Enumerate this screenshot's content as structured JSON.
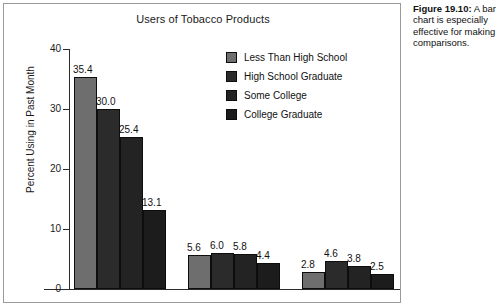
{
  "figure": {
    "caption_number": "Figure 19.10:",
    "caption_text": "A bar chart is especially effective for making comparisons."
  },
  "chart_data": {
    "type": "bar",
    "title": "Users of Tobacco Products",
    "xlabel": "",
    "ylabel": "Percent Using in Past Month",
    "ylim": [
      0,
      40
    ],
    "yticks": [
      0,
      10,
      20,
      30,
      40
    ],
    "ytick_labels": [
      "0",
      "10",
      "20",
      "30",
      "40"
    ],
    "grid": false,
    "legend_position": "upper right",
    "categories": [
      "Group 1",
      "Group 2",
      "Group 3"
    ],
    "category_labels": [
      "",
      "",
      ""
    ],
    "series": [
      {
        "name": "Less Than High School",
        "color": "#6e6e6e",
        "values": [
          35.4,
          5.6,
          2.8
        ],
        "value_labels": [
          "35.4",
          "5.6",
          "2.8"
        ]
      },
      {
        "name": "High School Graduate",
        "color": "#2b2b2b",
        "values": [
          30.0,
          6.0,
          4.6
        ],
        "value_labels": [
          "30.0",
          "6.0",
          "4.6"
        ]
      },
      {
        "name": "Some College",
        "color": "#232323",
        "values": [
          25.4,
          5.8,
          3.8
        ],
        "value_labels": [
          "25.4",
          "5.8",
          "3.8"
        ]
      },
      {
        "name": "College Graduate",
        "color": "#1c1c1c",
        "values": [
          13.1,
          4.4,
          2.5
        ],
        "value_labels": [
          "13.1",
          "4.4",
          "2.5"
        ]
      }
    ]
  }
}
